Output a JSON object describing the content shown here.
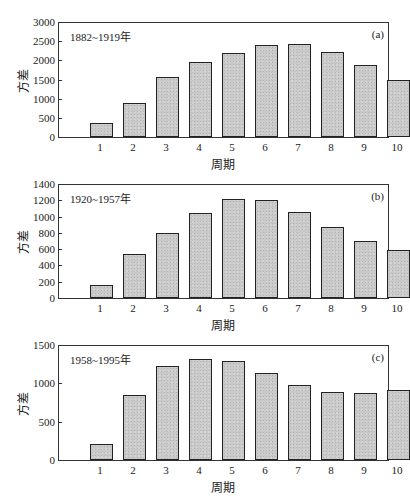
{
  "chart_data": [
    {
      "type": "bar",
      "panel_tag": "(a)",
      "period_label": "1882~1919年",
      "categories": [
        "1",
        "2",
        "3",
        "4",
        "5",
        "6",
        "7",
        "8",
        "9",
        "10"
      ],
      "values": [
        370,
        880,
        1570,
        1950,
        2200,
        2400,
        2430,
        2230,
        1880,
        1490
      ],
      "xlabel": "周期",
      "ylabel": "方差",
      "ylim": [
        0,
        3000
      ],
      "yticks": [
        "3000",
        "2500",
        "2000",
        "1500",
        "1000",
        "500",
        "0"
      ],
      "grid": false,
      "legend": "none"
    },
    {
      "type": "bar",
      "panel_tag": "(b)",
      "period_label": "1920~1957年",
      "categories": [
        "1",
        "2",
        "3",
        "4",
        "5",
        "6",
        "7",
        "8",
        "9",
        "10"
      ],
      "values": [
        160,
        540,
        800,
        1040,
        1210,
        1200,
        1060,
        870,
        700,
        590
      ],
      "xlabel": "周期",
      "ylabel": "方差",
      "ylim": [
        0,
        1400
      ],
      "yticks": [
        "1400",
        "1200",
        "1000",
        "800",
        "600",
        "400",
        "200",
        "0"
      ],
      "grid": false,
      "legend": "none"
    },
    {
      "type": "bar",
      "panel_tag": "(c)",
      "period_label": "1958~1995年",
      "categories": [
        "1",
        "2",
        "3",
        "4",
        "5",
        "6",
        "7",
        "8",
        "9",
        "10"
      ],
      "values": [
        210,
        850,
        1230,
        1320,
        1290,
        1140,
        980,
        890,
        880,
        910
      ],
      "xlabel": "周期",
      "ylabel": "方差",
      "ylim": [
        0,
        1500
      ],
      "yticks": [
        "1500",
        "1000",
        "500",
        "0"
      ],
      "grid": false,
      "legend": "none"
    }
  ],
  "layout": {
    "panels": [
      {
        "top": 22,
        "bottom": 137
      },
      {
        "top": 184,
        "bottom": 298
      },
      {
        "top": 345,
        "bottom": 460
      }
    ]
  }
}
